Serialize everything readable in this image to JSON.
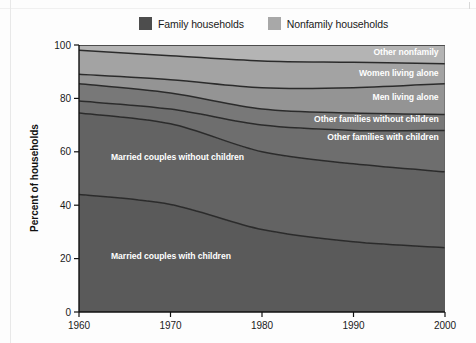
{
  "legend": {
    "items": [
      {
        "label": "Family households",
        "color": "#4d4d4d",
        "name": "family-households"
      },
      {
        "label": "Nonfamily households",
        "color": "#a8a8a8",
        "name": "nonfamily-households"
      }
    ]
  },
  "chart_data": {
    "type": "area",
    "title": "",
    "subtitle": "",
    "xlabel": "",
    "ylabel": "Percent of households",
    "x": [
      1960,
      1970,
      1980,
      1990,
      2000
    ],
    "xticklabels": [
      "1960",
      "1970",
      "1980",
      "1990",
      "2000"
    ],
    "xlim": [
      1960,
      2000
    ],
    "ylim": [
      0,
      100
    ],
    "yticks": [
      0,
      20,
      40,
      60,
      80,
      100
    ],
    "yticklabels": [
      "0",
      "20",
      "40",
      "60",
      "80",
      "100"
    ],
    "grid": false,
    "stacked": true,
    "stack_order": "bottom-to-top",
    "legend_position": "top-center",
    "series": [
      {
        "name": "Married couples with children",
        "group": "Family households",
        "color": "#5a5a5a",
        "values": [
          44.0,
          40.3,
          30.9,
          26.3,
          24.1
        ],
        "label_x": 1963.5,
        "label_y": 20,
        "label_anchor": "start"
      },
      {
        "name": "Married couples without children",
        "group": "Family households",
        "color": "#636363",
        "values": [
          30.5,
          30.2,
          29.1,
          29.2,
          28.4
        ],
        "label_x": 1963.5,
        "label_y": 57,
        "label_anchor": "start"
      },
      {
        "name": "Other families with children",
        "group": "Family households",
        "color": "#6e6e6e",
        "values": [
          4.5,
          5.5,
          10.0,
          12.5,
          15.5
        ],
        "label_x": 1999.3,
        "label_y": 64.5,
        "label_anchor": "end"
      },
      {
        "name": "Other families without children",
        "group": "Family households",
        "color": "#787878",
        "values": [
          6.5,
          6.0,
          6.0,
          6.5,
          6.0
        ],
        "label_x": 1999.3,
        "label_y": 71.3,
        "label_anchor": "end"
      },
      {
        "name": "Men living alone",
        "group": "Nonfamily households",
        "color": "#949494",
        "values": [
          3.5,
          5.0,
          8.0,
          9.5,
          11.5
        ],
        "label_x": 1999.3,
        "label_y": 79.4,
        "label_anchor": "end"
      },
      {
        "name": "Women living alone",
        "group": "Nonfamily households",
        "color": "#a3a3a3",
        "values": [
          9.0,
          9.0,
          10.0,
          9.5,
          7.5
        ],
        "label_x": 1999.3,
        "label_y": 88.5,
        "label_anchor": "end"
      },
      {
        "name": "Other nonfamily",
        "group": "Nonfamily households",
        "color": "#b4b4b4",
        "values": [
          2.0,
          4.0,
          6.0,
          6.5,
          7.0
        ],
        "label_x": 1999.3,
        "label_y": 96.4,
        "label_anchor": "end"
      }
    ],
    "cumulative_boundaries": {
      "married_with_children": [
        44.0,
        40.3,
        30.9,
        26.3,
        24.1
      ],
      "married_without_children": [
        74.5,
        70.5,
        60.0,
        55.5,
        52.5
      ],
      "other_families_with_children": [
        79.0,
        76.0,
        70.0,
        68.0,
        68.0
      ],
      "other_families_without_kids": [
        85.5,
        82.0,
        76.0,
        74.5,
        74.0
      ],
      "men_living_alone": [
        89.0,
        87.0,
        84.0,
        84.0,
        85.5
      ],
      "women_living_alone": [
        98.0,
        96.0,
        94.0,
        93.5,
        93.0
      ],
      "other_nonfamily": [
        100.0,
        100.0,
        100.0,
        100.0,
        100.0
      ]
    }
  },
  "colors": {
    "axis": "#111111",
    "divider": "#2b2b2b",
    "background": "#fdfdfd",
    "label_text": "#ffffff"
  }
}
